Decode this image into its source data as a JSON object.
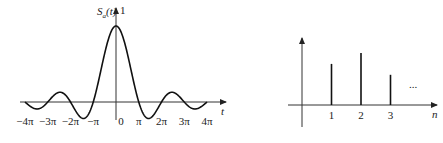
{
  "chart_data": [
    {
      "type": "line",
      "title": "",
      "ylabel": "S_a(t)",
      "ylabel_main": "S",
      "ylabel_sub": "a",
      "ylabel_arg": "(t)",
      "xlabel": "t",
      "y_peak_label": "1",
      "function": "Sa(t) = sin(t)/t",
      "xlim": [
        -12.566,
        12.566
      ],
      "ylim": [
        -0.25,
        1.0
      ],
      "x_ticks": [
        "-4π",
        "-3π",
        "-2π",
        "-π",
        "0",
        "π",
        "2π",
        "3π",
        "4π"
      ],
      "x_tick_values": [
        -12.566,
        -9.425,
        -6.283,
        -3.142,
        0,
        3.142,
        6.283,
        9.425,
        12.566
      ],
      "grid": false
    },
    {
      "type": "stem",
      "title": "",
      "xlabel": "n",
      "ylabel": "",
      "categories": [
        "1",
        "2",
        "3"
      ],
      "x": [
        1,
        2,
        3
      ],
      "values": [
        0.79,
        1.0,
        0.58
      ],
      "continuation": "...",
      "grid": false
    }
  ]
}
